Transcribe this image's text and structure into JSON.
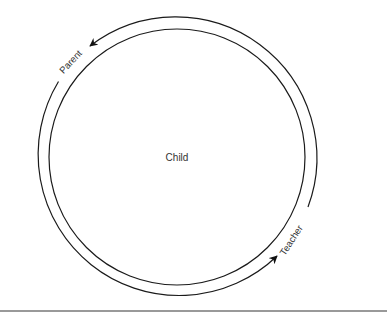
{
  "diagram": {
    "center_label": "Child",
    "arc_labels": {
      "top_left": "Parent",
      "bottom_right": "Teacher"
    },
    "colors": {
      "stroke": "#1a1a1a",
      "text": "#333333",
      "rule": "#777777",
      "background": "#ffffff"
    }
  }
}
